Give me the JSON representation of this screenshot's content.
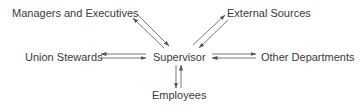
{
  "diagram": {
    "type": "hub-and-spoke communication diagram",
    "center": {
      "id": "supervisor",
      "label": "Supervisor"
    },
    "nodes": [
      {
        "id": "managers",
        "label": "Managers and Executives",
        "position": "top-left"
      },
      {
        "id": "external",
        "label": "External Sources",
        "position": "top-right"
      },
      {
        "id": "union",
        "label": "Union Stewards",
        "position": "left"
      },
      {
        "id": "other",
        "label": "Other Departments",
        "position": "right"
      },
      {
        "id": "employees",
        "label": "Employees",
        "position": "bottom"
      }
    ],
    "edges": [
      {
        "from": "supervisor",
        "to": "managers",
        "direction": "bidirectional"
      },
      {
        "from": "supervisor",
        "to": "external",
        "direction": "bidirectional"
      },
      {
        "from": "supervisor",
        "to": "union",
        "direction": "bidirectional"
      },
      {
        "from": "supervisor",
        "to": "other",
        "direction": "bidirectional"
      },
      {
        "from": "supervisor",
        "to": "employees",
        "direction": "bidirectional"
      }
    ],
    "colors": {
      "text": "#3a3a3a",
      "arrow": "#555555",
      "background": "#ffffff"
    }
  }
}
